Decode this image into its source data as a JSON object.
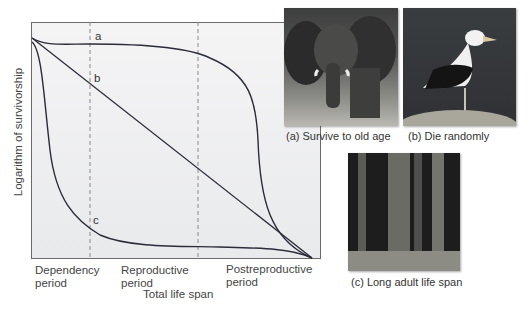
{
  "figure": {
    "y_axis_label": "Logarithm of survivorship",
    "x_axis_label": "Total life span",
    "periods": [
      {
        "line1": "Dependency",
        "line2": "period"
      },
      {
        "line1": "Reproductive",
        "line2": "period"
      },
      {
        "line1": "Postreproductive",
        "line2": "period"
      }
    ],
    "curve_labels": {
      "a": "a",
      "b": "b",
      "c": "c"
    },
    "colors": {
      "curve": "#2b2b3a",
      "dashed": "#8a8a8a",
      "frame": "#6a6a6a"
    }
  },
  "photos": [
    {
      "caption": "(a) Survive to old age",
      "subject": "elephant"
    },
    {
      "caption": "(b) Die randomly",
      "subject": "seagull"
    },
    {
      "caption": "(c) Long adult life span",
      "subject": "redwood trees"
    }
  ]
}
